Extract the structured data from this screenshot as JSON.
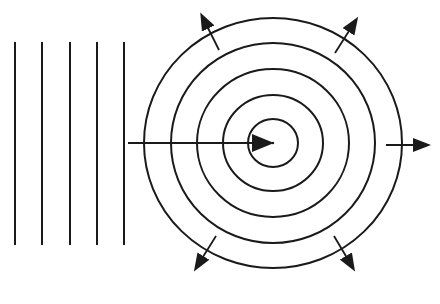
{
  "diagram": {
    "description": "Plane wavefronts approaching concentric circular wavefronts with outward propagation arrows",
    "colors": {
      "stroke": "#1a1a1a",
      "background": "#ffffff"
    },
    "plane_wave": {
      "lines_x": [
        15,
        42,
        70,
        97,
        124
      ],
      "y_top": 42,
      "y_bottom": 245
    },
    "circular_wave": {
      "center": [
        273,
        143
      ],
      "radii_x": [
        25,
        50,
        76,
        102,
        129
      ],
      "radii_y": [
        24,
        48,
        74,
        100,
        125
      ]
    },
    "arrows": [
      {
        "name": "incident-arrow",
        "from": [
          128,
          143
        ],
        "to": [
          270,
          143
        ]
      },
      {
        "name": "outgoing-arrow-right",
        "from": [
          386,
          145
        ],
        "to": [
          427,
          145
        ]
      },
      {
        "name": "outgoing-arrow-upper-left",
        "from": [
          219,
          50
        ],
        "to": [
          202,
          16
        ]
      },
      {
        "name": "outgoing-arrow-upper-right",
        "from": [
          335,
          53
        ],
        "to": [
          356,
          20
        ]
      },
      {
        "name": "outgoing-arrow-lower-left",
        "from": [
          216,
          236
        ],
        "to": [
          196,
          268
        ]
      },
      {
        "name": "outgoing-arrow-lower-right",
        "from": [
          334,
          236
        ],
        "to": [
          353,
          268
        ]
      }
    ]
  }
}
